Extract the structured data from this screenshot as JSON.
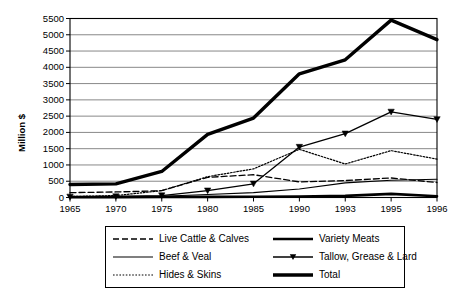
{
  "chart_data": {
    "type": "line",
    "title": "",
    "xlabel": "",
    "ylabel": "Million $",
    "categories": [
      "1965",
      "1970",
      "1975",
      "1980",
      "1985",
      "1990",
      "1993",
      "1995",
      "1996"
    ],
    "ylim": [
      0,
      5500
    ],
    "ytick_step": 500,
    "yticks": [
      "0",
      "500",
      "1000",
      "1500",
      "2000",
      "2500",
      "3000",
      "3500",
      "4000",
      "4500",
      "5000",
      "5500"
    ],
    "grid": "horizontal",
    "legend_position": "bottom",
    "series": [
      {
        "name": "Live Cattle & Calves",
        "style": "dashed",
        "marker": "none",
        "color": "#000000",
        "width": 1.3,
        "values": [
          150,
          170,
          210,
          620,
          700,
          480,
          520,
          600,
          460
        ]
      },
      {
        "name": "Beef & Veal",
        "style": "solid",
        "marker": "none",
        "color": "#000000",
        "width": 1.1,
        "values": [
          20,
          25,
          40,
          90,
          150,
          260,
          450,
          530,
          560
        ]
      },
      {
        "name": "Hides & Skins",
        "style": "dotted",
        "marker": "none",
        "color": "#000000",
        "width": 1.2,
        "values": [
          30,
          60,
          210,
          640,
          880,
          1480,
          1030,
          1440,
          1180
        ]
      },
      {
        "name": "Variety Meats",
        "style": "solid",
        "marker": "none",
        "color": "#000000",
        "width": 2.6,
        "values": [
          10,
          10,
          15,
          20,
          25,
          30,
          50,
          110,
          40
        ]
      },
      {
        "name": "Tallow, Grease & Lard",
        "style": "solid",
        "marker": "triangle-down",
        "color": "#000000",
        "width": 1.3,
        "values": [
          20,
          30,
          60,
          210,
          420,
          1550,
          1960,
          2630,
          2400
        ]
      },
      {
        "name": "Total",
        "style": "solid",
        "marker": "none",
        "color": "#000000",
        "width": 3.4,
        "values": [
          400,
          420,
          800,
          1940,
          2440,
          3800,
          4230,
          5450,
          4850
        ]
      }
    ]
  },
  "legend": {
    "items": [
      {
        "label": "Live Cattle & Calves"
      },
      {
        "label": "Variety Meats"
      },
      {
        "label": "Beef & Veal"
      },
      {
        "label": "Tallow, Grease & Lard"
      },
      {
        "label": "Hides & Skins"
      },
      {
        "label": "Total"
      }
    ]
  }
}
